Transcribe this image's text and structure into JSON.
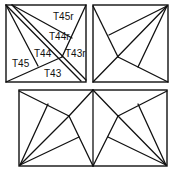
{
  "figure": {
    "panels": [
      {
        "id": "top-left",
        "labels": [
          {
            "text": "T45r",
            "x": 53,
            "y": 20
          },
          {
            "text": "T44r",
            "x": 49,
            "y": 40
          },
          {
            "text": "T43r",
            "x": 65,
            "y": 57
          },
          {
            "text": "T44",
            "x": 34,
            "y": 57
          },
          {
            "text": "T45",
            "x": 13,
            "y": 67
          },
          {
            "text": "T43",
            "x": 46,
            "y": 77
          }
        ]
      },
      {
        "id": "top-right",
        "labels": []
      },
      {
        "id": "bottom",
        "labels": []
      }
    ],
    "colors": {
      "line": "#111111",
      "background": "#ffffff"
    }
  }
}
